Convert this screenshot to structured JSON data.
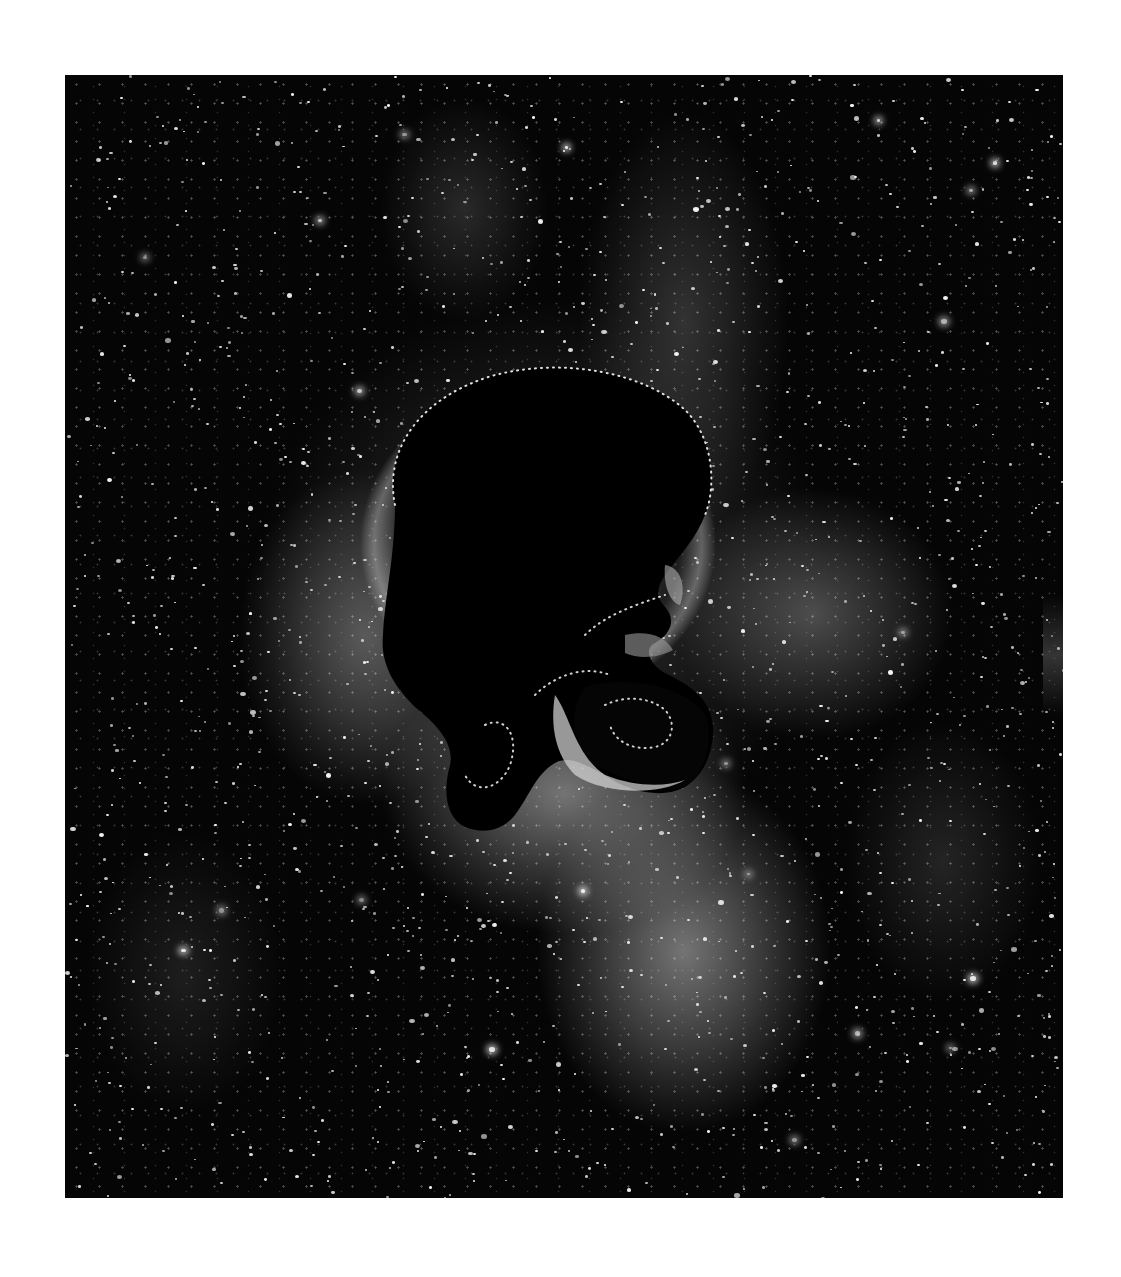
{
  "artwork": {
    "subject": "skull silhouette in profile against a starfield / galaxy nebula",
    "palette": {
      "background": "#ffffff",
      "space": "#050505",
      "stars": "#f4f4f4",
      "silhouette": "#000000",
      "silhouette_outline_dots": "#dcdcdc",
      "nebula_light": "#c8c8c8"
    },
    "frame": {
      "x": 65,
      "y": 75,
      "width": 998,
      "height": 1123
    }
  }
}
